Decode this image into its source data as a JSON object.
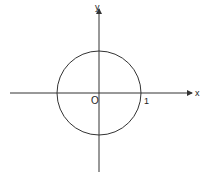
{
  "diagram": {
    "type": "unit-circle-on-axes",
    "axes": {
      "x_label": "x",
      "y_label": "y",
      "origin_label": "O",
      "x_arrow": true,
      "y_arrow": true
    },
    "circle": {
      "center": "O",
      "radius_label": "1"
    },
    "colors": {
      "stroke": "#333333",
      "background": "#ffffff"
    }
  }
}
